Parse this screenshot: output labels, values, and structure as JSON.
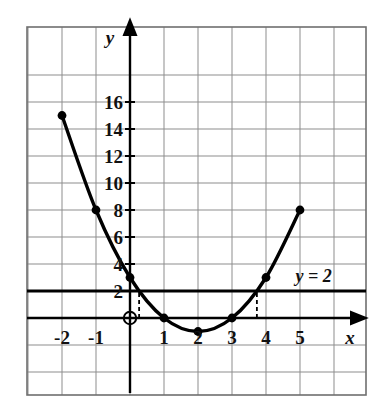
{
  "figure": {
    "kind": "coordinate-grid-graph",
    "axis_label_x": "x",
    "axis_label_y": "y",
    "origin_marker": "⊕",
    "background_color": "#ffffff",
    "grid_color": "#8d8d8d",
    "border_color": "#6f6f6f",
    "curve_color": "#000000",
    "line_color": "#000000"
  },
  "chart_data": {
    "type": "line",
    "title": "",
    "xlabel": "x",
    "ylabel": "y",
    "xlim": [
      -3,
      7
    ],
    "ylim": [
      -3,
      18
    ],
    "grid": true,
    "x_tick_labels": [
      "-2",
      "-1",
      "1",
      "2",
      "3",
      "4",
      "5"
    ],
    "x_ticks": [
      -2,
      -1,
      1,
      2,
      3,
      4,
      5
    ],
    "y_tick_labels": [
      "2",
      "4",
      "6",
      "8",
      "10",
      "12",
      "14",
      "16"
    ],
    "y_ticks": [
      2,
      4,
      6,
      8,
      10,
      12,
      14,
      16
    ],
    "x_grid_step": 1,
    "y_grid_step": 2,
    "series": [
      {
        "name": "parabola",
        "marker": "filled-circle",
        "x": [
          -2,
          -1,
          0,
          1,
          2,
          3,
          4,
          5
        ],
        "values": [
          15,
          8,
          3,
          0,
          -1,
          0,
          3,
          8
        ]
      },
      {
        "name": "horizontal-line",
        "marker": "none",
        "x": [
          -3,
          7
        ],
        "values": [
          2,
          2
        ]
      }
    ],
    "annotations": [
      {
        "name": "line-equation",
        "text": "y = 2",
        "x": 5.4,
        "y": 3.1
      },
      {
        "name": "origin",
        "text": "⊕",
        "x": 0,
        "y": 0
      }
    ],
    "guides": [
      {
        "name": "left-intersection-dashed",
        "x": 0.268,
        "y_from": 0,
        "y_to": 2
      },
      {
        "name": "right-intersection-dashed",
        "x": 3.732,
        "y_from": 0,
        "y_to": 2
      }
    ]
  }
}
